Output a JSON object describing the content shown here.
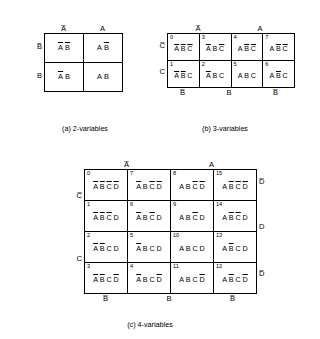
{
  "figure": {
    "title_note": "Karnaugh map cell designations for 2, 3 and 4 variables"
  },
  "map2": {
    "caption": "(a) 2-variables",
    "col_headers": [
      "A̅",
      "A"
    ],
    "row_headers": [
      "B̅",
      "B"
    ],
    "rows": [
      {
        "cells": [
          {
            "number": "",
            "parts": [
              {
                "t": "A",
                "bar": true
              },
              {
                "t": "B",
                "bar": true
              }
            ]
          },
          {
            "number": "",
            "parts": [
              {
                "t": "A",
                "bar": false
              },
              {
                "t": "B",
                "bar": true
              }
            ]
          }
        ]
      },
      {
        "cells": [
          {
            "number": "",
            "parts": [
              {
                "t": "A",
                "bar": true
              },
              {
                "t": "B",
                "bar": false
              }
            ]
          },
          {
            "number": "",
            "parts": [
              {
                "t": "A",
                "bar": false
              },
              {
                "t": "B",
                "bar": false
              }
            ]
          }
        ]
      }
    ]
  },
  "map3": {
    "caption": "(b) 3-variables",
    "top_headers": [
      "A̅",
      "A"
    ],
    "bottom_headers": [
      "B̅",
      "B",
      "B̅"
    ],
    "row_headers": [
      "C̅",
      "C"
    ],
    "rows": [
      {
        "cells": [
          {
            "number": "0",
            "parts": [
              {
                "t": "A",
                "bar": true
              },
              {
                "t": "B",
                "bar": true
              },
              {
                "t": "C",
                "bar": true
              }
            ]
          },
          {
            "number": "3",
            "parts": [
              {
                "t": "A",
                "bar": true
              },
              {
                "t": "B",
                "bar": false
              },
              {
                "t": "C",
                "bar": true
              }
            ]
          },
          {
            "number": "4",
            "parts": [
              {
                "t": "A",
                "bar": false
              },
              {
                "t": "B",
                "bar": true
              },
              {
                "t": "C",
                "bar": true
              }
            ]
          },
          {
            "number": "7",
            "parts": [
              {
                "t": "A",
                "bar": false
              },
              {
                "t": "B",
                "bar": true
              },
              {
                "t": "C",
                "bar": true
              }
            ]
          }
        ]
      },
      {
        "cells": [
          {
            "number": "1",
            "parts": [
              {
                "t": "A",
                "bar": true
              },
              {
                "t": "B",
                "bar": true
              },
              {
                "t": "C",
                "bar": false
              }
            ]
          },
          {
            "number": "2",
            "parts": [
              {
                "t": "A",
                "bar": true
              },
              {
                "t": "B",
                "bar": false
              },
              {
                "t": "C",
                "bar": false
              }
            ]
          },
          {
            "number": "5",
            "parts": [
              {
                "t": "A",
                "bar": false
              },
              {
                "t": "B",
                "bar": false
              },
              {
                "t": "C",
                "bar": false
              }
            ]
          },
          {
            "number": "6",
            "parts": [
              {
                "t": "A",
                "bar": false
              },
              {
                "t": "B",
                "bar": true
              },
              {
                "t": "C",
                "bar": false
              }
            ]
          }
        ]
      }
    ]
  },
  "map4": {
    "caption": "(c) 4-variables",
    "top_headers": [
      "A̅",
      "A"
    ],
    "bottom_headers": [
      "B̅",
      "B",
      "B̅"
    ],
    "left_headers": [
      "C̅",
      "C"
    ],
    "right_headers": [
      "D̅",
      "D",
      "D̅"
    ],
    "rows": [
      {
        "cells": [
          {
            "number": "0",
            "parts": [
              {
                "t": "A",
                "bar": true
              },
              {
                "t": "B",
                "bar": true
              },
              {
                "t": "C",
                "bar": true
              },
              {
                "t": "D",
                "bar": true
              }
            ]
          },
          {
            "number": "7",
            "parts": [
              {
                "t": "A",
                "bar": true
              },
              {
                "t": "B",
                "bar": false
              },
              {
                "t": "C",
                "bar": true
              },
              {
                "t": "D",
                "bar": true
              }
            ]
          },
          {
            "number": "8",
            "parts": [
              {
                "t": "A",
                "bar": false
              },
              {
                "t": "B",
                "bar": false
              },
              {
                "t": "C",
                "bar": true
              },
              {
                "t": "D",
                "bar": true
              }
            ]
          },
          {
            "number": "15",
            "parts": [
              {
                "t": "A",
                "bar": false
              },
              {
                "t": "B",
                "bar": true
              },
              {
                "t": "C",
                "bar": true
              },
              {
                "t": "D",
                "bar": true
              }
            ]
          }
        ]
      },
      {
        "cells": [
          {
            "number": "1",
            "parts": [
              {
                "t": "A",
                "bar": true
              },
              {
                "t": "B",
                "bar": true
              },
              {
                "t": "C",
                "bar": true
              },
              {
                "t": "D",
                "bar": false
              }
            ]
          },
          {
            "number": "6",
            "parts": [
              {
                "t": "A",
                "bar": true
              },
              {
                "t": "B",
                "bar": false
              },
              {
                "t": "C",
                "bar": true
              },
              {
                "t": "D",
                "bar": false
              }
            ]
          },
          {
            "number": "9",
            "parts": [
              {
                "t": "A",
                "bar": false
              },
              {
                "t": "B",
                "bar": false
              },
              {
                "t": "C",
                "bar": true
              },
              {
                "t": "D",
                "bar": false
              }
            ]
          },
          {
            "number": "14",
            "parts": [
              {
                "t": "A",
                "bar": false
              },
              {
                "t": "B",
                "bar": true
              },
              {
                "t": "C",
                "bar": true
              },
              {
                "t": "D",
                "bar": false
              }
            ]
          }
        ]
      },
      {
        "cells": [
          {
            "number": "2",
            "parts": [
              {
                "t": "A",
                "bar": true
              },
              {
                "t": "B",
                "bar": true
              },
              {
                "t": "C",
                "bar": false
              },
              {
                "t": "D",
                "bar": false
              }
            ]
          },
          {
            "number": "5",
            "parts": [
              {
                "t": "A",
                "bar": true
              },
              {
                "t": "B",
                "bar": false
              },
              {
                "t": "C",
                "bar": false
              },
              {
                "t": "D",
                "bar": false
              }
            ]
          },
          {
            "number": "10",
            "parts": [
              {
                "t": "A",
                "bar": false
              },
              {
                "t": "B",
                "bar": false
              },
              {
                "t": "C",
                "bar": false
              },
              {
                "t": "D",
                "bar": false
              }
            ]
          },
          {
            "number": "13",
            "parts": [
              {
                "t": "A",
                "bar": false
              },
              {
                "t": "B",
                "bar": true
              },
              {
                "t": "C",
                "bar": false
              },
              {
                "t": "D",
                "bar": false
              }
            ]
          }
        ]
      },
      {
        "cells": [
          {
            "number": "3",
            "parts": [
              {
                "t": "A",
                "bar": true
              },
              {
                "t": "B",
                "bar": true
              },
              {
                "t": "C",
                "bar": false
              },
              {
                "t": "D",
                "bar": true
              }
            ]
          },
          {
            "number": "4",
            "parts": [
              {
                "t": "A",
                "bar": true
              },
              {
                "t": "B",
                "bar": false
              },
              {
                "t": "C",
                "bar": false
              },
              {
                "t": "D",
                "bar": true
              }
            ]
          },
          {
            "number": "11",
            "parts": [
              {
                "t": "A",
                "bar": false
              },
              {
                "t": "B",
                "bar": false
              },
              {
                "t": "C",
                "bar": false
              },
              {
                "t": "D",
                "bar": true
              }
            ]
          },
          {
            "number": "12",
            "parts": [
              {
                "t": "A",
                "bar": false
              },
              {
                "t": "B",
                "bar": true
              },
              {
                "t": "C",
                "bar": false
              },
              {
                "t": "D",
                "bar": true
              }
            ]
          }
        ]
      }
    ]
  },
  "colors": {
    "ink": "#000000",
    "paper": "#ffffff"
  }
}
